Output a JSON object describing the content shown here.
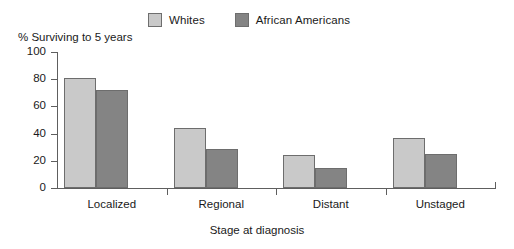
{
  "chart_data": {
    "type": "bar",
    "title": "",
    "xlabel": "Stage at diagnosis",
    "ylabel": "% Surviving to 5 years",
    "categories": [
      "Localized",
      "Regional",
      "Distant",
      "Unstaged"
    ],
    "series": [
      {
        "name": "Whites",
        "color": "#c9c9c9",
        "values": [
          81,
          44,
          24,
          37
        ]
      },
      {
        "name": "African Americans",
        "color": "#848484",
        "values": [
          72,
          29,
          15,
          25
        ]
      }
    ],
    "ylim": [
      0,
      100
    ],
    "yticks": [
      0,
      20,
      40,
      60,
      80,
      100
    ],
    "ytick_labels": [
      "0",
      "20",
      "40",
      "60",
      "80",
      "100"
    ],
    "grid": false,
    "legend_position": "top"
  },
  "legend": {
    "entries": [
      {
        "label": "Whites",
        "swatch": "#c9c9c9"
      },
      {
        "label": "African Americans",
        "swatch": "#848484"
      }
    ]
  },
  "axes": {
    "y_title": "% Surviving to 5 years",
    "x_title": "Stage at diagnosis"
  }
}
